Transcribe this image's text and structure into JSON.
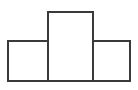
{
  "figure": {
    "canvas": {
      "width": 138,
      "height": 90,
      "background_color": "#ffffff"
    },
    "style": {
      "stroke_color": "#3a3a3a",
      "stroke_width": 1.6,
      "fill_color": "#ffffff"
    }
  },
  "chart_data": {
    "type": "diagram",
    "xlabel": "",
    "ylabel": "",
    "grid": false,
    "legend": null,
    "xlim": [
      0,
      138
    ],
    "ylim": [
      0,
      90
    ],
    "shapes": [
      {
        "name": "left-rectangle",
        "kind": "rectangle",
        "x": 8,
        "y": 41,
        "width": 40,
        "height": 40,
        "fill": "#ffffff",
        "stroke": "#3a3a3a"
      },
      {
        "name": "center-rectangle",
        "kind": "rectangle",
        "x": 48,
        "y": 12,
        "width": 45,
        "height": 69,
        "fill": "#ffffff",
        "stroke": "#3a3a3a"
      },
      {
        "name": "right-rectangle",
        "kind": "rectangle",
        "x": 93,
        "y": 41,
        "width": 37,
        "height": 40,
        "fill": "#ffffff",
        "stroke": "#3a3a3a"
      }
    ],
    "annotations": [],
    "labels": []
  }
}
